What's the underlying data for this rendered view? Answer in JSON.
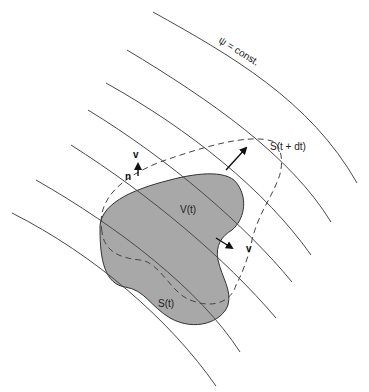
{
  "diagram": {
    "colors": {
      "background": "#ffffff",
      "streamline": "#4a4a4a",
      "region_fill": "#a8a8a8",
      "region_stroke": "#333333",
      "dashed": "#444444",
      "arrow": "#111111"
    },
    "labels": {
      "streamline_label": "ψ = const.",
      "volume": "V(t)",
      "surface_t": "S(t)",
      "surface_t_dt": "S(t + dt)",
      "velocity_top": "v",
      "normal": "n",
      "velocity_right": "v"
    },
    "streamlines_count": 7
  }
}
